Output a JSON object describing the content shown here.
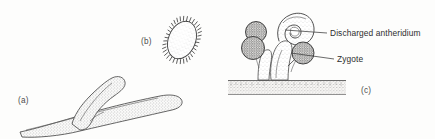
{
  "figure": {
    "kind": "scientific-line-drawing",
    "style": "pen-and-ink stipple",
    "background_color": "#fdfdfc",
    "ink_color": "#3f3f3f",
    "width": 435,
    "height": 139,
    "panels": [
      {
        "id": "a",
        "label": "(a)",
        "label_x": 18,
        "label_y": 103,
        "subject": "branching hypha",
        "description": "A thick tubular hypha running diagonally with a single lateral branch rising upward, rendered with stipple shading and rounded blunt tips."
      },
      {
        "id": "b",
        "label": "(b)",
        "label_x": 141,
        "label_y": 44,
        "subject": "ciliated oval spore",
        "description": "A tilted ovoid cell fringed with short radiating cilia around its entire margin, lightly stippled inside.",
        "cilia_count": 30
      },
      {
        "id": "c",
        "label": "(c)",
        "label_x": 361,
        "label_y": 93,
        "subject": "reproductive structure on substrate",
        "description": "A stalked structure rising from a stippled substrate band, bearing a curled discharged antheridium and three dark stippled spherical zygotes."
      }
    ],
    "callouts": [
      {
        "id": "discharged-antheridium",
        "text": "Discharged antheridium",
        "text_x": 330,
        "text_y": 36,
        "leader_from_x": 285,
        "leader_from_y": 30,
        "leader_to_x": 327,
        "leader_to_y": 33,
        "points_to": "curled empty antheridium hook at top of structure"
      },
      {
        "id": "zygote",
        "text": "Zygote",
        "text_x": 337,
        "text_y": 62,
        "leader_from_x": 291,
        "leader_from_y": 53,
        "leader_to_x": 334,
        "leader_to_y": 59,
        "points_to": "dark stippled spherical zygote on right side"
      }
    ],
    "substrate": {
      "label": "substrate band",
      "x": 228,
      "y": 80,
      "width": 118,
      "height": 15,
      "fill": "#f2f1ee"
    }
  }
}
